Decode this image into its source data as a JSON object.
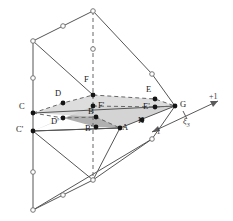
{
  "figure": {
    "type": "geometric-diagram",
    "background": "#ffffff",
    "line_color": "#555555",
    "dashed_color": "#666666",
    "node_fill_open": "#ffffff",
    "node_fill_solid": "#141414",
    "shade_upper": "#d8d8d8",
    "shade_lower": "#b0b0b0",
    "text_color": "#1a1a1a"
  },
  "nodes": [
    {
      "id": "A",
      "label": "A",
      "x": 120,
      "y": 128,
      "lx": 122,
      "ly": 127,
      "style": "solid"
    },
    {
      "id": "B",
      "label": "B",
      "x": 96,
      "y": 117,
      "lx": 88,
      "ly": 111,
      "style": "solid"
    },
    {
      "id": "Bp",
      "label": "B'",
      "x": 96,
      "y": 127,
      "lx": 86,
      "ly": 128,
      "style": "solid"
    },
    {
      "id": "C",
      "label": "C",
      "x": 33,
      "y": 113,
      "lx": 20,
      "ly": 106,
      "style": "solid"
    },
    {
      "id": "Cp",
      "label": "C'",
      "x": 33,
      "y": 131,
      "lx": 18,
      "ly": 129,
      "style": "solid"
    },
    {
      "id": "D",
      "label": "D",
      "x": 63,
      "y": 103,
      "lx": 56,
      "ly": 93,
      "style": "solid"
    },
    {
      "id": "Dp",
      "label": "D'",
      "x": 63,
      "y": 118,
      "lx": 52,
      "ly": 120,
      "style": "solid"
    },
    {
      "id": "E",
      "label": "E",
      "x": 155,
      "y": 99,
      "lx": 146,
      "ly": 89,
      "style": "solid"
    },
    {
      "id": "Ep",
      "label": "E'",
      "x": 155,
      "y": 107,
      "lx": 143,
      "ly": 106,
      "style": "solid"
    },
    {
      "id": "F",
      "label": "F",
      "x": 93,
      "y": 95,
      "lx": 84,
      "ly": 79,
      "style": "solid"
    },
    {
      "id": "Fp",
      "label": "F'",
      "x": 93,
      "y": 106,
      "lx": 97,
      "ly": 105,
      "style": "solid"
    },
    {
      "id": "G",
      "label": "G",
      "x": 175,
      "y": 106,
      "lx": 179,
      "ly": 103,
      "style": "solid"
    },
    {
      "id": "H",
      "label": "H",
      "x": 142,
      "y": 120,
      "lx": 138,
      "ly": 119,
      "style": "solid"
    }
  ],
  "corner_nodes": [
    {
      "id": "top-apex",
      "x": 93,
      "y": 11
    },
    {
      "id": "top-left",
      "x": 33,
      "y": 41
    },
    {
      "id": "top-mid-edge",
      "x": 63,
      "y": 26
    },
    {
      "id": "mid-dash",
      "x": 93,
      "y": 49
    },
    {
      "id": "left-mid",
      "x": 33,
      "y": 78
    },
    {
      "id": "bot-apex",
      "x": 93,
      "y": 180
    },
    {
      "id": "bot-left",
      "x": 33,
      "y": 210
    },
    {
      "id": "bot-mid-edge",
      "x": 63,
      "y": 195
    },
    {
      "id": "left-low",
      "x": 33,
      "y": 172
    },
    {
      "id": "right-upper",
      "x": 152,
      "y": 74
    },
    {
      "id": "right-lower",
      "x": 152,
      "y": 139
    }
  ],
  "axis": {
    "name": "xi3-axis",
    "symbol": "ξ",
    "subscript": "3",
    "min_label": "−1",
    "max_label": "+1",
    "start": {
      "x": 152,
      "y": 132
    },
    "end": {
      "x": 218,
      "y": 101
    },
    "tick": {
      "x": 185,
      "y": 117
    },
    "symbol_pos": {
      "x": 183,
      "y": 119
    },
    "min_pos": {
      "x": 152,
      "y": 131
    },
    "max_pos": {
      "x": 212,
      "y": 97
    }
  },
  "shaded_faces": [
    {
      "name": "upper-mid-surface",
      "fill": "#d8d8d8",
      "opacity": 0.9,
      "points": "33,113 63,103 93,95 155,99 175,106 120,128 96,117"
    },
    {
      "name": "lower-mid-surface",
      "fill": "#b0b0b0",
      "opacity": 0.9,
      "points": "33,131 63,118 96,127 120,128 175,106 155,107 93,106"
    }
  ],
  "solid_edges": [
    "33,41 93,11",
    "93,11 152,74",
    "33,41 33,113",
    "33,113 33,131",
    "33,131 33,172",
    "33,172 33,210",
    "33,41 93,95",
    "93,11 93,49",
    "152,74 175,106",
    "33,113 175,106",
    "33,131 120,128",
    "120,128 175,106",
    "33,210 93,180",
    "93,180 152,139",
    "33,210 152,139",
    "33,131 93,180",
    "152,139 175,106",
    "33,210 33,131",
    "120,128 93,180"
  ],
  "dashed_edges": [
    "93,11 93,49",
    "93,49 93,95",
    "93,95 93,106",
    "93,106 93,180",
    "33,113 63,103 93,95",
    "93,95 155,99 175,106",
    "33,113 63,103",
    "63,103 93,95",
    "93,106 155,107",
    "155,107 175,106",
    "33,113 96,117",
    "96,117 120,128"
  ]
}
